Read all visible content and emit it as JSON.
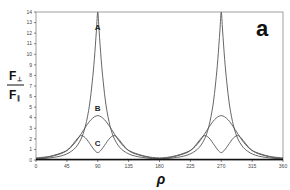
{
  "chart_data": {
    "type": "line",
    "panel_label": "a",
    "title": "",
    "xlabel": "ρ",
    "ylabel": "F⊥ / F∥",
    "ylabel_parts": {
      "numerator": "F",
      "numerator_sub": "⊥",
      "denominator": "F",
      "denominator_sub": "∥"
    },
    "xlim": [
      0,
      360
    ],
    "ylim": [
      0,
      14
    ],
    "x_ticks": [
      0,
      45,
      90,
      135,
      180,
      225,
      270,
      315,
      360
    ],
    "y_ticks": [
      0,
      1,
      2,
      3,
      4,
      5,
      6,
      7,
      8,
      9,
      10,
      11,
      12,
      13,
      14
    ],
    "grid": false,
    "legend": "inline curve labels",
    "series": [
      {
        "name": "A",
        "label_pos": [
          90,
          12.3
        ],
        "x": [
          0,
          20,
          40,
          55,
          65,
          72,
          78,
          82,
          85,
          88,
          90,
          92,
          95,
          98,
          102,
          108,
          115,
          125,
          140,
          160,
          180,
          200,
          220,
          235,
          245,
          252,
          258,
          262,
          265,
          268,
          270,
          272,
          275,
          278,
          282,
          288,
          295,
          305,
          320,
          340,
          360
        ],
        "y": [
          0.1,
          0.2,
          0.45,
          1.0,
          1.9,
          3.2,
          5.2,
          7.4,
          9.5,
          12.2,
          14,
          12.2,
          9.5,
          7.4,
          5.2,
          3.2,
          1.9,
          1.0,
          0.45,
          0.2,
          0.1,
          0.2,
          0.45,
          1.0,
          1.9,
          3.2,
          5.2,
          7.4,
          9.5,
          12.2,
          14,
          12.2,
          9.5,
          7.4,
          5.2,
          3.2,
          1.9,
          1.0,
          0.45,
          0.2,
          0.1
        ]
      },
      {
        "name": "B",
        "label_pos": [
          90,
          4.6
        ],
        "x": [
          0,
          20,
          40,
          50,
          60,
          70,
          80,
          90,
          100,
          110,
          120,
          130,
          140,
          160,
          180,
          200,
          220,
          230,
          240,
          250,
          260,
          270,
          280,
          290,
          300,
          310,
          320,
          340,
          360
        ],
        "y": [
          0.2,
          0.35,
          0.75,
          1.15,
          1.9,
          2.9,
          3.8,
          4.2,
          3.8,
          2.9,
          1.9,
          1.15,
          0.75,
          0.35,
          0.2,
          0.35,
          0.75,
          1.15,
          1.9,
          2.9,
          3.8,
          4.2,
          3.8,
          2.9,
          1.9,
          1.15,
          0.75,
          0.35,
          0.2
        ]
      },
      {
        "name": "C",
        "label_pos": [
          90,
          1.3
        ],
        "x": [
          0,
          20,
          40,
          50,
          58,
          65,
          72,
          80,
          85,
          90,
          95,
          100,
          108,
          115,
          122,
          130,
          140,
          160,
          180,
          200,
          220,
          230,
          238,
          245,
          252,
          260,
          265,
          270,
          275,
          280,
          288,
          295,
          302,
          310,
          320,
          340,
          360
        ],
        "y": [
          0.12,
          0.3,
          0.7,
          1.2,
          1.85,
          2.3,
          2.1,
          1.4,
          0.95,
          0.7,
          0.95,
          1.4,
          2.1,
          2.3,
          1.85,
          1.2,
          0.7,
          0.3,
          0.12,
          0.3,
          0.7,
          1.2,
          1.85,
          2.3,
          2.1,
          1.4,
          0.95,
          0.7,
          0.95,
          1.4,
          2.1,
          2.3,
          1.85,
          1.2,
          0.7,
          0.3,
          0.12
        ]
      }
    ]
  },
  "colors": {
    "curve": "#555555",
    "axis": "#333333",
    "baseline": "#111111",
    "background": "#ffffff"
  },
  "layout": {
    "plot_left": 36,
    "plot_right": 283,
    "plot_top": 12,
    "plot_bottom": 160
  }
}
